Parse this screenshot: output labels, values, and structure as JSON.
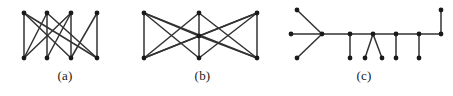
{
  "figure": {
    "background_color": "#ffffff",
    "vertex_color": "#1a1a1a",
    "edge_color": "#333333",
    "subfigures": [
      {
        "id": "a",
        "caption": "(a)",
        "description": "zigzag graph on eight vertices",
        "vertex_count": 8,
        "edge_count": 11,
        "vertices": [
          {
            "id": "t1",
            "x": 24,
            "y": 13
          },
          {
            "id": "t2",
            "x": 47,
            "y": 13
          },
          {
            "id": "t3",
            "x": 71,
            "y": 13
          },
          {
            "id": "t4",
            "x": 97,
            "y": 13
          },
          {
            "id": "b1",
            "x": 24,
            "y": 58
          },
          {
            "id": "b2",
            "x": 47,
            "y": 58
          },
          {
            "id": "b3",
            "x": 71,
            "y": 58
          },
          {
            "id": "b4",
            "x": 97,
            "y": 58
          }
        ],
        "edges": [
          [
            "t1",
            "b1"
          ],
          [
            "t2",
            "b2"
          ],
          [
            "t3",
            "b3"
          ],
          [
            "t4",
            "b4"
          ],
          [
            "t1",
            "b3"
          ],
          [
            "t2",
            "b1"
          ],
          [
            "t3",
            "b2"
          ],
          [
            "t4",
            "b3"
          ],
          [
            "t1",
            "b4"
          ],
          [
            "t3",
            "b1"
          ],
          [
            "t2",
            "b4"
          ]
        ]
      },
      {
        "id": "b",
        "caption": "(b)",
        "description": "three column graph with crossing edges",
        "vertex_count": 7,
        "edge_count": 14,
        "vertices": [
          {
            "id": "lt",
            "x": 14,
            "y": 13
          },
          {
            "id": "lb",
            "x": 14,
            "y": 58
          },
          {
            "id": "mt",
            "x": 69,
            "y": 13
          },
          {
            "id": "mm",
            "x": 69,
            "y": 36
          },
          {
            "id": "mb",
            "x": 69,
            "y": 58
          },
          {
            "id": "rt",
            "x": 127,
            "y": 13
          },
          {
            "id": "rb",
            "x": 127,
            "y": 58
          }
        ],
        "edges": [
          [
            "lt",
            "lb"
          ],
          [
            "mt",
            "mm"
          ],
          [
            "mm",
            "mb"
          ],
          [
            "rt",
            "rb"
          ],
          [
            "lt",
            "mm"
          ],
          [
            "lt",
            "mb"
          ],
          [
            "lb",
            "mt"
          ],
          [
            "lb",
            "mm"
          ],
          [
            "rt",
            "mm"
          ],
          [
            "rt",
            "mb"
          ],
          [
            "rb",
            "mt"
          ],
          [
            "rb",
            "mm"
          ],
          [
            "lt",
            "rb"
          ],
          [
            "lb",
            "rt"
          ]
        ]
      },
      {
        "id": "c",
        "caption": "(c)",
        "description": "caterpillar tree with spine and pendant vertices",
        "vertex_count": 14,
        "edge_count": 13,
        "vertices": [
          {
            "id": "f1",
            "x": 22,
            "y": 10
          },
          {
            "id": "f2",
            "x": 22,
            "y": 58
          },
          {
            "id": "f3",
            "x": 16,
            "y": 34
          },
          {
            "id": "s1",
            "x": 47,
            "y": 34
          },
          {
            "id": "s2",
            "x": 75,
            "y": 34
          },
          {
            "id": "s3",
            "x": 98,
            "y": 34
          },
          {
            "id": "s4",
            "x": 121,
            "y": 34
          },
          {
            "id": "s5",
            "x": 144,
            "y": 34
          },
          {
            "id": "s6",
            "x": 166,
            "y": 34
          },
          {
            "id": "p2",
            "x": 75,
            "y": 58
          },
          {
            "id": "p3a",
            "x": 90,
            "y": 58
          },
          {
            "id": "p3b",
            "x": 107,
            "y": 58
          },
          {
            "id": "p4",
            "x": 121,
            "y": 58
          },
          {
            "id": "p5",
            "x": 144,
            "y": 58
          },
          {
            "id": "top6",
            "x": 166,
            "y": 10
          }
        ],
        "edges": [
          [
            "f1",
            "s1"
          ],
          [
            "f2",
            "s1"
          ],
          [
            "f3",
            "s1"
          ],
          [
            "s1",
            "s2"
          ],
          [
            "s2",
            "s3"
          ],
          [
            "s3",
            "s4"
          ],
          [
            "s4",
            "s5"
          ],
          [
            "s5",
            "s6"
          ],
          [
            "s2",
            "p2"
          ],
          [
            "s3",
            "p3a"
          ],
          [
            "s3",
            "p3b"
          ],
          [
            "s4",
            "p4"
          ],
          [
            "s5",
            "p5"
          ],
          [
            "s6",
            "top6"
          ]
        ]
      }
    ]
  }
}
